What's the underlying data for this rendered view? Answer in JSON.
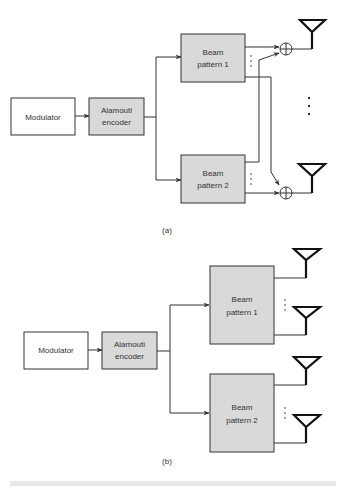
{
  "diagram_a": {
    "label": "(a)",
    "modulator": "Modulator",
    "encoder_line1": "Alamouti",
    "encoder_line2": "encoder",
    "beam1_line1": "Beam",
    "beam1_line2": "pattern 1",
    "beam2_line1": "Beam",
    "beam2_line2": "pattern 2"
  },
  "diagram_b": {
    "label": "(b)",
    "modulator": "Modulator",
    "encoder_line1": "Alamouti",
    "encoder_line2": "encoder",
    "beam1_line1": "Beam",
    "beam1_line2": "pattern 1",
    "beam2_line1": "Beam",
    "beam2_line2": "pattern 2"
  },
  "colors": {
    "block_gray": "#d9d9d9",
    "line": "#333333"
  }
}
